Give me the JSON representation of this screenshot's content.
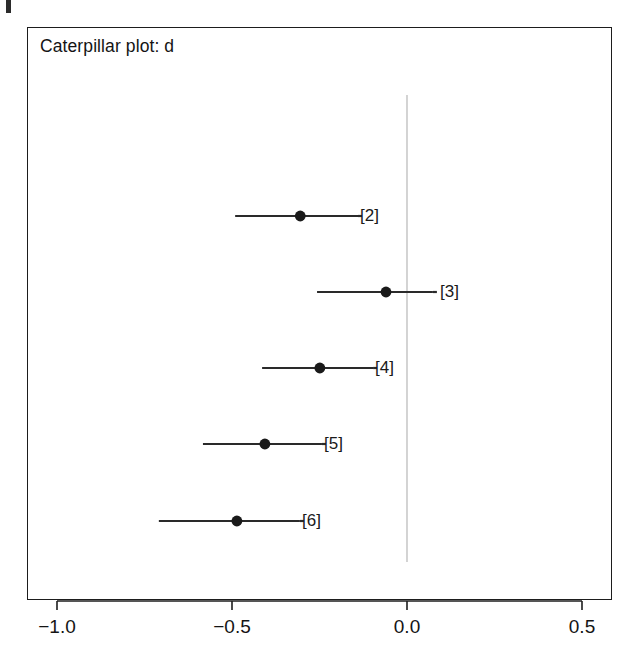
{
  "page": {
    "background_color": "#ffffff",
    "frame_color": "#1d1d1d",
    "edge_mark_label": ""
  },
  "plot": {
    "title": "Caterpillar plot: d",
    "zero_line_color": "#c9c9c9",
    "marker_color": "#1a1a1a",
    "interval_color": "#2a2a2a"
  },
  "axis": {
    "tick_labels": [
      "−1.0",
      "−0.5",
      "0.0",
      "0.5"
    ],
    "tick_values": [
      -1.0,
      -0.5,
      0.0,
      0.5
    ]
  },
  "rows": [
    {
      "label": "[2]"
    },
    {
      "label": "[3]"
    },
    {
      "label": "[4]"
    },
    {
      "label": "[5]"
    },
    {
      "label": "[6]"
    }
  ],
  "chart_data": {
    "type": "scatter",
    "subtype": "caterpillar-plot",
    "title": "Caterpillar plot: d",
    "xlabel": "",
    "ylabel": "",
    "xlim": [
      -1.15,
      0.585
    ],
    "grid": false,
    "legend": null,
    "zero_reference_line": 0.0,
    "categories": [
      "[2]",
      "[3]",
      "[4]",
      "[5]",
      "[6]"
    ],
    "values": [
      -0.305,
      -0.06,
      -0.249,
      -0.406,
      -0.486
    ],
    "intervals_low": [
      -0.491,
      -0.257,
      -0.414,
      -0.583,
      -0.709
    ],
    "intervals_high": [
      -0.14,
      0.074,
      -0.097,
      -0.243,
      -0.306
    ],
    "series": [
      {
        "name": "d",
        "points": [
          {
            "label": "[2]",
            "estimate": -0.305,
            "lower": -0.491,
            "upper": -0.14
          },
          {
            "label": "[3]",
            "estimate": -0.06,
            "lower": -0.257,
            "upper": 0.074
          },
          {
            "label": "[4]",
            "estimate": -0.249,
            "lower": -0.414,
            "upper": -0.097
          },
          {
            "label": "[5]",
            "estimate": -0.406,
            "lower": -0.583,
            "upper": -0.243
          },
          {
            "label": "[6]",
            "estimate": -0.486,
            "lower": -0.709,
            "upper": -0.306
          }
        ]
      }
    ]
  }
}
